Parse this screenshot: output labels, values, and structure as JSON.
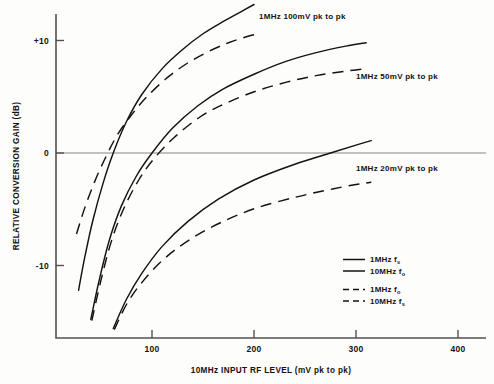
{
  "chart_data": {
    "type": "line",
    "title": "",
    "xlabel": "10MHz INPUT RF LEVEL (mV pk to pk)",
    "ylabel": "RELATIVE CONVERSION GAIN (dB)",
    "xlim": [
      20,
      420
    ],
    "ylim": [
      -16,
      14
    ],
    "xticks": [
      100,
      200,
      300,
      400
    ],
    "xtick_labels": [
      "100",
      "200",
      "300",
      "400"
    ],
    "yticks": [
      10,
      0,
      -10
    ],
    "ytick_labels": [
      "+10",
      "0",
      "-10"
    ],
    "grid": false,
    "zero_reference_line": true,
    "annotations": [
      {
        "text": "1MHz 100mV pk to pk",
        "x": 205,
        "y": 11.9
      },
      {
        "text": "1MHz 50mV pk to pk",
        "x": 300,
        "y": 6.6
      },
      {
        "text": "1MHz 20mV pk to pk",
        "x": 300,
        "y": -1.6
      }
    ],
    "legend_position": "lower-right",
    "legend": [
      {
        "label": "1MHz f",
        "sub": "s",
        "style": "solid"
      },
      {
        "label": "10MHz f",
        "sub": "o",
        "style": "solid"
      },
      {
        "label": "1MHz f",
        "sub": "o",
        "style": "dashed"
      },
      {
        "label": "10MHz f",
        "sub": "s",
        "style": "dashed"
      }
    ],
    "series": [
      {
        "name": "1MHz 100mV pk to pk - solid (1MHz fs / 10MHz fo)",
        "style": "solid",
        "group": "100mV",
        "points": [
          [
            28,
            -12.2
          ],
          [
            34,
            -9.3
          ],
          [
            42,
            -6.0
          ],
          [
            52,
            -2.7
          ],
          [
            62,
            0.0
          ],
          [
            75,
            2.8
          ],
          [
            90,
            5.2
          ],
          [
            110,
            7.5
          ],
          [
            130,
            9.2
          ],
          [
            150,
            10.6
          ],
          [
            170,
            11.7
          ],
          [
            190,
            12.7
          ],
          [
            200,
            13.2
          ]
        ]
      },
      {
        "name": "1MHz 100mV pk to pk - dashed (1MHz fo / 10MHz fs)",
        "style": "dashed",
        "group": "100mV",
        "points": [
          [
            26,
            -7.2
          ],
          [
            34,
            -4.9
          ],
          [
            44,
            -2.5
          ],
          [
            55,
            -0.3
          ],
          [
            66,
            1.6
          ],
          [
            80,
            3.4
          ],
          [
            95,
            5.0
          ],
          [
            115,
            6.7
          ],
          [
            135,
            8.0
          ],
          [
            155,
            9.0
          ],
          [
            175,
            9.8
          ],
          [
            195,
            10.4
          ],
          [
            205,
            10.6
          ]
        ]
      },
      {
        "name": "1MHz 50mV pk to pk - solid (1MHz fs / 10MHz fo)",
        "style": "solid",
        "group": "50mV",
        "points": [
          [
            40,
            -14.8
          ],
          [
            48,
            -11.4
          ],
          [
            58,
            -7.8
          ],
          [
            70,
            -4.7
          ],
          [
            85,
            -2.0
          ],
          [
            100,
            0.0
          ],
          [
            120,
            2.2
          ],
          [
            145,
            4.2
          ],
          [
            170,
            5.7
          ],
          [
            200,
            7.0
          ],
          [
            230,
            8.1
          ],
          [
            260,
            8.9
          ],
          [
            290,
            9.5
          ],
          [
            310,
            9.8
          ]
        ]
      },
      {
        "name": "1MHz 50mV pk to pk - dashed (1MHz fo / 10MHz fs)",
        "style": "dashed",
        "group": "50mV",
        "points": [
          [
            41,
            -14.9
          ],
          [
            50,
            -11.3
          ],
          [
            60,
            -7.9
          ],
          [
            72,
            -5.0
          ],
          [
            87,
            -2.4
          ],
          [
            102,
            -0.5
          ],
          [
            122,
            1.4
          ],
          [
            147,
            3.2
          ],
          [
            172,
            4.4
          ],
          [
            202,
            5.5
          ],
          [
            232,
            6.3
          ],
          [
            262,
            6.9
          ],
          [
            292,
            7.3
          ],
          [
            310,
            7.5
          ]
        ]
      },
      {
        "name": "1MHz 20mV pk to pk - solid (1MHz fs / 10MHz fo)",
        "style": "solid",
        "group": "20mV",
        "points": [
          [
            62,
            -15.6
          ],
          [
            75,
            -13.0
          ],
          [
            90,
            -10.7
          ],
          [
            110,
            -8.3
          ],
          [
            135,
            -6.1
          ],
          [
            165,
            -4.1
          ],
          [
            200,
            -2.4
          ],
          [
            240,
            -1.0
          ],
          [
            275,
            0.0
          ],
          [
            300,
            0.7
          ],
          [
            315,
            1.1
          ]
        ]
      },
      {
        "name": "1MHz 20mV pk to pk - dashed (1MHz fo / 10MHz fs)",
        "style": "dashed",
        "group": "20mV",
        "points": [
          [
            63,
            -15.7
          ],
          [
            76,
            -13.3
          ],
          [
            92,
            -11.3
          ],
          [
            112,
            -9.4
          ],
          [
            137,
            -7.7
          ],
          [
            167,
            -6.2
          ],
          [
            202,
            -4.9
          ],
          [
            242,
            -3.9
          ],
          [
            277,
            -3.2
          ],
          [
            300,
            -2.8
          ],
          [
            315,
            -2.6
          ]
        ]
      }
    ]
  },
  "colors": {
    "curve": "#17120f",
    "axis": "#55504e",
    "zero_line": "#8a8785",
    "background": "#fdfdfc"
  }
}
